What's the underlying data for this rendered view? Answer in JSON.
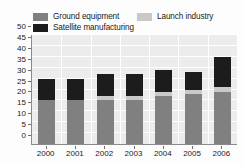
{
  "legend": {
    "items": [
      {
        "label": "Ground equipment",
        "color": "#808080",
        "key": "ground"
      },
      {
        "label": "Satellite manufacturing",
        "color": "#1c1c1c",
        "key": "satellite"
      },
      {
        "label": "Launch industry",
        "color": "#c9c9c9",
        "key": "launch"
      }
    ]
  },
  "chart_data": {
    "type": "bar",
    "subtype": "stacked-vertical",
    "title": "",
    "xlabel": "",
    "ylabel": "",
    "categories": [
      "2000",
      "2001",
      "2002",
      "2003",
      "2004",
      "2005",
      "2006"
    ],
    "series": [
      {
        "name": "Ground equipment",
        "color": "#808080",
        "values": [
          20,
          20,
          20,
          20,
          22,
          23,
          24
        ]
      },
      {
        "name": "Launch industry",
        "color": "#c9c9c9",
        "values": [
          0,
          0,
          2,
          2,
          2,
          2,
          2
        ]
      },
      {
        "name": "Satellite manufacturing",
        "color": "#1c1c1c",
        "values": [
          10,
          10,
          10,
          10,
          10,
          8,
          14
        ]
      }
    ],
    "totals": [
      30,
      30,
      32,
      32,
      34,
      33,
      40
    ],
    "ylim": [
      0,
      50
    ],
    "yticks": [
      0,
      5,
      10,
      15,
      20,
      25,
      30,
      35,
      40,
      45,
      50
    ],
    "ytick_labels": [
      "0",
      "5",
      "10",
      "15",
      "20",
      "25",
      "30",
      "35",
      "40",
      "45",
      "50"
    ],
    "xtick_labels": [
      "2000",
      "2001",
      "2002",
      "2003",
      "2004",
      "2005",
      "2006"
    ],
    "grid": "horizontal-white",
    "legend_position": "top"
  }
}
